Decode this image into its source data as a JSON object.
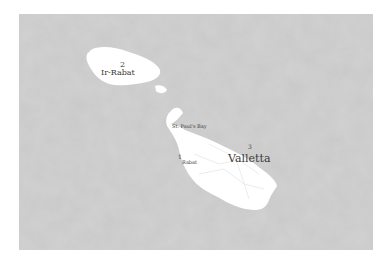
{
  "map": {
    "background_color": "#c9c9c9",
    "land_color": "#ffffff",
    "islands": [
      "Gozo",
      "Comino",
      "Malta"
    ],
    "labels": [
      {
        "number": "2",
        "name": "Ir-Rabat"
      },
      {
        "number": "",
        "name": "St. Paul's Bay"
      },
      {
        "number": "1",
        "name": "Rabat"
      },
      {
        "number": "3",
        "name": "Valletta"
      }
    ]
  }
}
